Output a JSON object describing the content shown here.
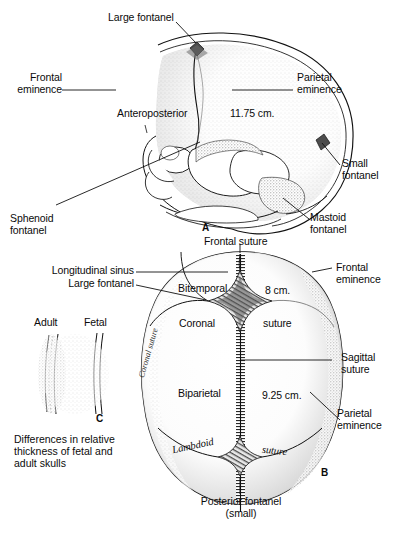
{
  "figure": {
    "background": "#ffffff",
    "ink": "#0b0b0b"
  },
  "panel_a": {
    "mark": "A",
    "measurement": "11.75 cm.",
    "labels": {
      "large_fontanel": "Large fontanel",
      "frontal_eminence": "Frontal\neminence",
      "parietal_eminence": "Parietal\neminence",
      "anteroposterior": "Anteroposterior",
      "small_fontanel": "Small\nfontanel",
      "mastoid_fontanel": "Mastoid\nfontanel",
      "sphenoid_fontanel": "Sphenoid\nfontanel"
    }
  },
  "panel_b": {
    "mark": "B",
    "measurement_transverse": "8 cm.",
    "measurement_longitudinal": "9.25 cm.",
    "labels": {
      "frontal_suture": "Frontal suture",
      "longitudinal_sinus": "Longitudinal sinus",
      "large_fontanel": "Large fontanel",
      "bitemporal": "Bitemporal",
      "coronal": "Coronal",
      "coronal_suture_script": "Coronal suture",
      "suture": "suture",
      "biparietal": "Biparietal",
      "lambdoid": "Lambdoid",
      "lambdoid_suture": "suture",
      "frontal_eminence": "Frontal\neminence",
      "sagittal_suture": "Sagittal\nsuture",
      "parietal_eminence": "Parietal\neminence",
      "posterior_fontanel": "Posterior fontanel\n(small)"
    }
  },
  "panel_c": {
    "mark": "C",
    "labels": {
      "adult": "Adult",
      "fetal": "Fetal",
      "caption": "Differences in relative\nthickness of fetal and\nadult skulls"
    }
  }
}
